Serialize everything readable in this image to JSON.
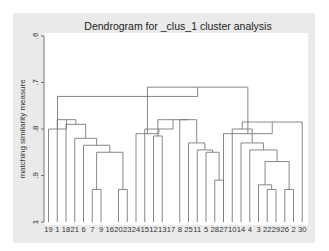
{
  "chart_data": {
    "type": "dendrogram",
    "title": "Dendrogram for _clus_1 cluster analysis",
    "xlabel": "",
    "ylabel": "matching similarity measure",
    "ylim": [
      0.6,
      1.0
    ],
    "y_ticks": [
      ".6",
      ".7",
      ".8",
      ".9",
      "1"
    ],
    "y_tick_values": [
      0.6,
      0.7,
      0.8,
      0.9,
      1.0
    ],
    "grid": false,
    "leaves": [
      "19",
      "1",
      "18",
      "21",
      "6",
      "7",
      "9",
      "16",
      "20",
      "23",
      "24",
      "15",
      "12",
      "13",
      "17",
      "8",
      "25",
      "11",
      "5",
      "28",
      "27",
      "10",
      "14",
      "4",
      "3",
      "22",
      "29",
      "26",
      "2",
      "30"
    ],
    "merges": [
      {
        "left": 5,
        "right": 6,
        "height": 0.93
      },
      {
        "left": 8,
        "right": 9,
        "height": 0.93
      },
      {
        "left": "m0",
        "right": "m1",
        "height": 0.85
      },
      {
        "left": 4,
        "right": "m2",
        "height": 0.835
      },
      {
        "left": 3,
        "right": "m3",
        "height": 0.82
      },
      {
        "left": 2,
        "right": "m4",
        "height": 0.79
      },
      {
        "left": 1,
        "right": "m5",
        "height": 0.78
      },
      {
        "left": 0,
        "right": "m6",
        "height": 0.8
      },
      {
        "left": 12,
        "right": 13,
        "height": 0.815
      },
      {
        "left": 19,
        "right": 20,
        "height": 0.91
      },
      {
        "left": 18,
        "right": "m9",
        "height": 0.85
      },
      {
        "left": 17,
        "right": "m10",
        "height": 0.845
      },
      {
        "left": 16,
        "right": "m11",
        "height": 0.83
      },
      {
        "left": 15,
        "right": "m12",
        "height": 0.78
      },
      {
        "left": "m8",
        "right": "m13",
        "height": 0.78
      },
      {
        "left": 11,
        "right": "m14",
        "height": 0.8
      },
      {
        "left": 10,
        "right": "m15",
        "height": 0.81
      },
      {
        "left": 25,
        "right": 26,
        "height": 0.93
      },
      {
        "left": 24,
        "right": "m17",
        "height": 0.92
      },
      {
        "left": 27,
        "right": 28,
        "height": 0.93
      },
      {
        "left": "m18",
        "right": "m19",
        "height": 0.87
      },
      {
        "left": 23,
        "right": "m20",
        "height": 0.845
      },
      {
        "left": 22,
        "right": "m21",
        "height": 0.83
      },
      {
        "left": 21,
        "right": "m22",
        "height": 0.8
      },
      {
        "left": 29,
        "right": "m23",
        "height": 0.785
      },
      {
        "left": 20,
        "right": "m24",
        "height": 0.81
      },
      {
        "left": "m16",
        "right": "m25",
        "height": 0.71
      },
      {
        "left": "m7",
        "right": "m26",
        "height": 0.73
      }
    ]
  },
  "layout": {
    "title": "Dendrogram for _clus_1 cluster analysis",
    "ylabel": "matching similarity measure"
  }
}
